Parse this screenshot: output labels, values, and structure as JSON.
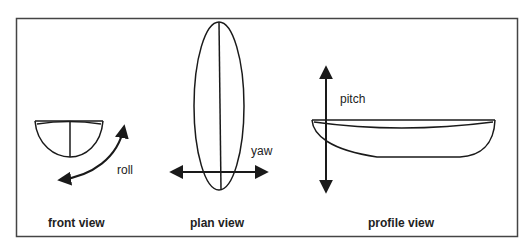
{
  "diagram": {
    "views": [
      {
        "id": "front",
        "caption": "front view",
        "motion": "roll"
      },
      {
        "id": "plan",
        "caption": "plan view",
        "motion": "yaw"
      },
      {
        "id": "profile",
        "caption": "profile view",
        "motion": "pitch"
      }
    ],
    "colors": {
      "stroke": "#1a1a1a",
      "frame": "#444444",
      "background": "#ffffff"
    }
  }
}
